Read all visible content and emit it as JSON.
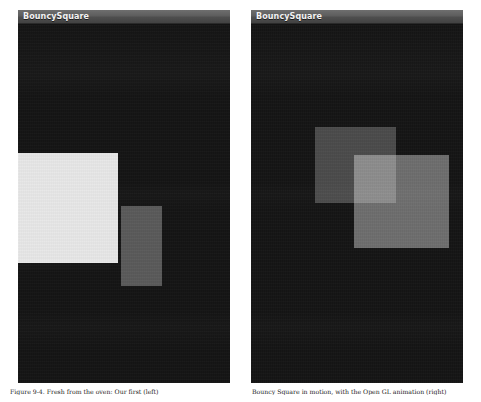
{
  "figure": {
    "caption_left": "Figure 9-4. Fresh from the oven: Our first (left)",
    "caption_right": "Bouncy Square in motion, with the Open GL animation (right)"
  },
  "panels": [
    {
      "id": "left",
      "app_title": "BouncySquare",
      "canvas_background": "#141414",
      "squares": [
        {
          "name": "back-square",
          "color": "#e8e8e8",
          "opacity": 1,
          "x": 0,
          "y": 128,
          "width": 100,
          "height": 110
        },
        {
          "name": "front-square",
          "color": "#e2e2e2",
          "opacity": 0.34,
          "x": 103,
          "y": 181,
          "width": 41,
          "height": 80
        }
      ]
    },
    {
      "id": "right",
      "app_title": "BouncySquare",
      "canvas_background": "#141414",
      "squares": [
        {
          "name": "back-square",
          "color": "#dadada",
          "opacity": 0.28,
          "x": 64,
          "y": 102,
          "width": 81,
          "height": 76
        },
        {
          "name": "front-square",
          "color": "#e2e2e2",
          "opacity": 0.44,
          "x": 103,
          "y": 130,
          "width": 95,
          "height": 93
        }
      ]
    }
  ]
}
